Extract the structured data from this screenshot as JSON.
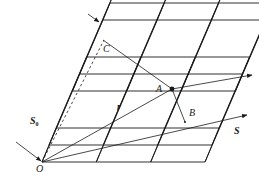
{
  "figure": {
    "colors": {
      "line": "#1a1a1a",
      "background": "#ffffff"
    },
    "labels": {
      "origin": "O",
      "incident_beam": "S",
      "incident_beam_sub": "0",
      "scattered_beam": "S",
      "point_a": "A",
      "point_b": "B",
      "point_c": "C",
      "position_vector": "r"
    },
    "lattice": {
      "cells_along_a": 3,
      "cells_along_b": 2,
      "cells_along_c": 2
    }
  }
}
